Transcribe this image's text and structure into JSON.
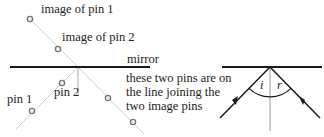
{
  "diagram": {
    "left": {
      "labels": {
        "image_pin1": "image of pin 1",
        "image_pin2": "image of pin 2",
        "mirror": "mirror",
        "pin1": "pin 1",
        "pin2": "pin 2",
        "note_line1": "these two pins are on",
        "note_line2": "the line joining the",
        "note_line3": "two image pins"
      }
    },
    "right": {
      "labels": {
        "angle_incidence": "i",
        "angle_reflection": "r"
      }
    },
    "colors": {
      "line": "#1a1a1a",
      "ray_faint": "#c8c8c8",
      "pin": "#777777",
      "normal": "#999999"
    }
  }
}
